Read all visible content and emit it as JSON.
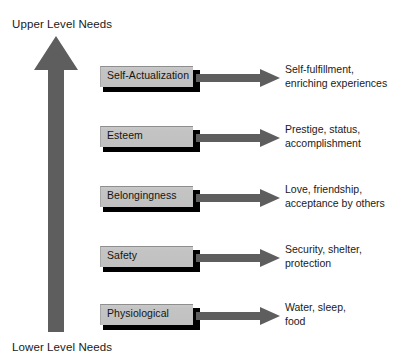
{
  "diagram": {
    "title_top": "Upper Level Needs",
    "title_bottom": "Lower Level Needs",
    "arrow_color": "#5e5e5e",
    "box_fill_color": "#c4c4c4",
    "box_shadow_color": "#000000",
    "text_color": "#1a1a1a",
    "background_color": "#ffffff",
    "levels": [
      {
        "label": "Self-Actualization",
        "description_line1": "Self-fulfillment,",
        "description_line2": "enriching experiences"
      },
      {
        "label": "Esteem",
        "description_line1": "Prestige, status,",
        "description_line2": "accomplishment"
      },
      {
        "label": "Belongingness",
        "description_line1": "Love, friendship,",
        "description_line2": "acceptance by others"
      },
      {
        "label": "Safety",
        "description_line1": "Security, shelter,",
        "description_line2": "protection"
      },
      {
        "label": "Physiological",
        "description_line1": "Water, sleep,",
        "description_line2": "food"
      }
    ]
  }
}
